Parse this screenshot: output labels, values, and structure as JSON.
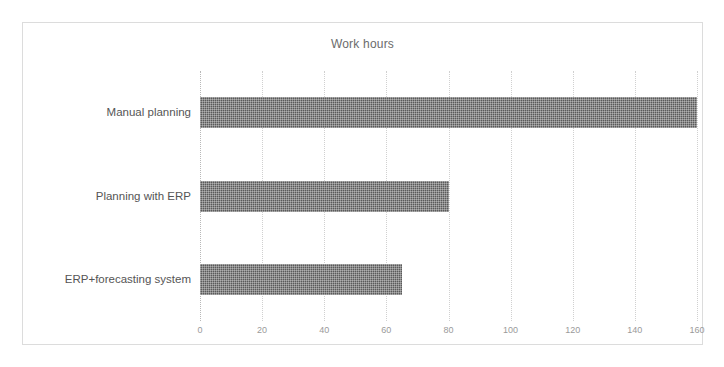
{
  "chart_data": {
    "type": "bar",
    "orientation": "horizontal",
    "title": "Work hours",
    "xlabel": "",
    "ylabel": "",
    "categories": [
      "Manual planning",
      "Planning with ERP",
      "ERP+forecasting system"
    ],
    "values": [
      160,
      80,
      65
    ],
    "series": [
      {
        "name": "Work hours",
        "values": [
          160,
          80,
          65
        ]
      }
    ],
    "xlim": [
      0,
      160
    ],
    "xticks": [
      0,
      20,
      40,
      60,
      80,
      100,
      120,
      140,
      160
    ],
    "xtick_labels": [
      "0",
      "20",
      "40",
      "60",
      "80",
      "100",
      "120",
      "140",
      "160"
    ],
    "grid": true,
    "grid_axis": "x",
    "legend": false,
    "legend_position": "none",
    "bar_color": "#5a5a5a",
    "grid_color": "#d0d0d0",
    "title_color": "#6b6b6b",
    "tick_label_color": "#9a9a9a",
    "category_label_color": "#555555",
    "border_color": "#dcdcdc",
    "background_color": "#ffffff"
  }
}
